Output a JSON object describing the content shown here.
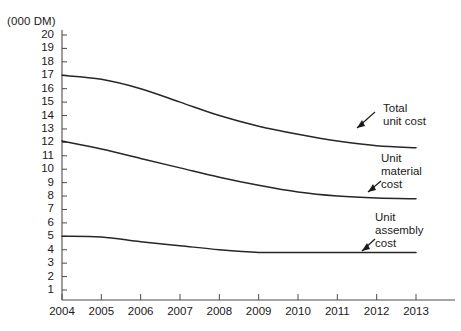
{
  "chart_data": {
    "type": "line",
    "title": "",
    "subtitle": "",
    "xlabel": "",
    "ylabel": "(000 DM)",
    "unit_label": "(000 DM)",
    "x": [
      2004,
      2005,
      2006,
      2007,
      2008,
      2009,
      2010,
      2011,
      2012,
      2013
    ],
    "categories": [
      "2004",
      "2005",
      "2006",
      "2007",
      "2008",
      "2009",
      "2010",
      "2011",
      "2012",
      "2013"
    ],
    "xlim": [
      2004,
      2013
    ],
    "ylim": [
      0,
      20
    ],
    "ytick_labels": [
      "20",
      "19",
      "18",
      "17",
      "16",
      "15",
      "14",
      "13",
      "12",
      "11",
      "10",
      "9",
      "8",
      "7",
      "6",
      "5",
      "4",
      "3",
      "2",
      "1"
    ],
    "ytick_values": [
      20,
      19,
      18,
      17,
      16,
      15,
      14,
      13,
      12,
      11,
      10,
      9,
      8,
      7,
      6,
      5,
      4,
      3,
      2,
      1
    ],
    "grid": false,
    "legend": "none",
    "series": [
      {
        "name": "Total unit cost",
        "values": [
          17.0,
          16.7,
          16.0,
          15.0,
          14.0,
          13.2,
          12.6,
          12.1,
          11.75,
          11.6
        ]
      },
      {
        "name": "Unit material cost",
        "values": [
          12.1,
          11.5,
          10.8,
          10.1,
          9.4,
          8.8,
          8.3,
          8.0,
          7.85,
          7.8
        ]
      },
      {
        "name": "Unit assembly cost",
        "values": [
          5.0,
          4.95,
          4.6,
          4.3,
          4.0,
          3.8,
          3.8,
          3.8,
          3.8,
          3.8
        ]
      }
    ],
    "annotations": [
      {
        "name": "total-unit-cost",
        "text": "Total\nunit cost"
      },
      {
        "name": "unit-material-cost",
        "text": "Unit\nmaterial\ncost"
      },
      {
        "name": "unit-assembly-cost",
        "text": "Unit\nassembly\ncost"
      }
    ],
    "colors": {
      "line": "#262626",
      "axis": "#4d4d4d",
      "text": "#1a1a1a",
      "background": "#ffffff"
    }
  }
}
